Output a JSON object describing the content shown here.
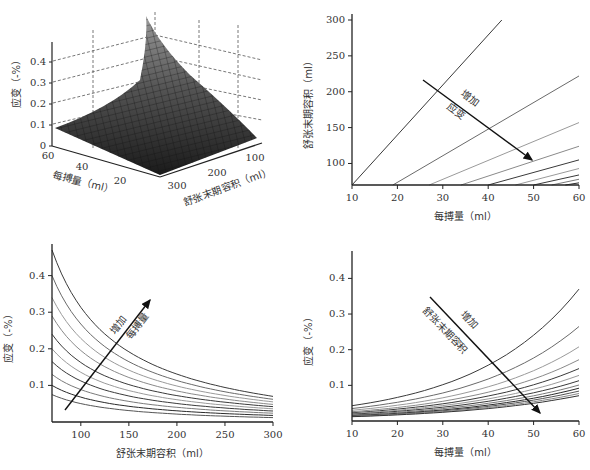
{
  "chart_data": [
    {
      "id": "surface",
      "type": "surface3d",
      "title": "",
      "zlabel": "应变（-%）",
      "xlabel": "每搏量（ml）",
      "ylabel": "舒张末期容积（ml）",
      "z_ticks": [
        "0",
        "0.1",
        "0.2",
        "0.3",
        "0.4"
      ],
      "x_ticks": [
        "60",
        "40",
        "20"
      ],
      "y_ticks": [
        "300",
        "200",
        "100"
      ],
      "zlim": [
        0,
        0.47
      ],
      "xlim": [
        10,
        60
      ],
      "ylim": [
        70,
        300
      ],
      "description": "Strain surface increasing with stroke volume and decreasing with end-diastolic volume; peak ~0.47 at SV=60, EDV=70"
    },
    {
      "id": "contour-lines",
      "type": "line",
      "xlabel": "每搏量（ml）",
      "ylabel": "舒张末期容积（ml）",
      "x_ticks": [
        "10",
        "20",
        "30",
        "40",
        "50",
        "60"
      ],
      "y_ticks": [
        "100",
        "150",
        "200",
        "250",
        "300"
      ],
      "xlim": [
        10,
        60
      ],
      "ylim": [
        70,
        300
      ],
      "annotation": {
        "line1": "增加",
        "line2": "应变"
      },
      "series": [
        {
          "name": "iso1",
          "x": [
            10,
            43
          ],
          "y": [
            70,
            300
          ]
        },
        {
          "name": "iso2",
          "x": [
            19,
            60
          ],
          "y": [
            70,
            222
          ]
        },
        {
          "name": "iso3",
          "x": [
            27,
            60
          ],
          "y": [
            70,
            157
          ]
        },
        {
          "name": "iso4",
          "x": [
            34,
            60
          ],
          "y": [
            70,
            124
          ]
        },
        {
          "name": "iso5",
          "x": [
            40,
            60
          ],
          "y": [
            70,
            105
          ]
        },
        {
          "name": "iso6",
          "x": [
            46,
            60
          ],
          "y": [
            70,
            93
          ]
        },
        {
          "name": "iso7",
          "x": [
            50,
            60
          ],
          "y": [
            70,
            84
          ]
        },
        {
          "name": "iso8",
          "x": [
            54,
            60
          ],
          "y": [
            70,
            78
          ]
        },
        {
          "name": "iso9",
          "x": [
            57,
            60
          ],
          "y": [
            70,
            73
          ]
        }
      ]
    },
    {
      "id": "strain-vs-edv",
      "type": "line",
      "xlabel": "舒张末期容积（ml）",
      "ylabel": "应变（-%）",
      "x_ticks": [
        "100",
        "150",
        "200",
        "250",
        "300"
      ],
      "y_ticks": [
        "0.1",
        "0.2",
        "0.3",
        "0.4"
      ],
      "xlim": [
        70,
        300
      ],
      "ylim": [
        0,
        0.47
      ],
      "annotation": {
        "line1": "增加",
        "line2": "每搏量"
      },
      "series_start_at_70": [
        0.47,
        0.4,
        0.34,
        0.29,
        0.24,
        0.2,
        0.165,
        0.13,
        0.1,
        0.075
      ],
      "series_end_at_300": [
        0.07,
        0.062,
        0.055,
        0.048,
        0.042,
        0.036,
        0.03,
        0.024,
        0.018,
        0.012
      ]
    },
    {
      "id": "strain-vs-sv",
      "type": "line",
      "xlabel": "每搏量（ml）",
      "ylabel": "应变（-%）",
      "x_ticks": [
        "10",
        "20",
        "30",
        "40",
        "50",
        "60"
      ],
      "y_ticks": [
        "0.1",
        "0.2",
        "0.3",
        "0.4"
      ],
      "xlim": [
        10,
        60
      ],
      "ylim": [
        0,
        0.46
      ],
      "annotation": {
        "line1": "增加",
        "line2": "舒张末期容积"
      },
      "series_end_at_60": [
        0.37,
        0.265,
        0.208,
        0.172,
        0.147,
        0.128,
        0.113,
        0.101,
        0.092,
        0.084,
        0.077,
        0.071
      ],
      "series_start_at_10": [
        0.043,
        0.035,
        0.03,
        0.026,
        0.023,
        0.021,
        0.019,
        0.017,
        0.015,
        0.014,
        0.013,
        0.012
      ]
    }
  ],
  "colors": {
    "axis": "#222222",
    "dark_line": "#3a3a3a",
    "light_line": "#9a9a9a",
    "surface_dark": "#2a2a2a",
    "surface_light": "#8a8a8a"
  }
}
